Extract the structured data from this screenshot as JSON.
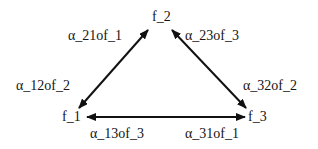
{
  "diagram": {
    "type": "triangle-graph",
    "nodes": [
      {
        "id": "f_2",
        "label": "f_2"
      },
      {
        "id": "f_1",
        "label": "f_1"
      },
      {
        "id": "f_3",
        "label": "f_3"
      }
    ],
    "edges": [
      {
        "from": "f_1",
        "to": "f_2",
        "bidirectional": true,
        "labels": [
          "α_21of_1",
          "α_12of_2"
        ]
      },
      {
        "from": "f_2",
        "to": "f_3",
        "bidirectional": true,
        "labels": [
          "α_23of_3",
          "α_32of_2"
        ]
      },
      {
        "from": "f_1",
        "to": "f_3",
        "bidirectional": true,
        "labels": [
          "α_13of_3",
          "α_31of_1"
        ]
      }
    ],
    "edge_labels": {
      "a21": "α_21of_1",
      "a23": "α_23of_3",
      "a12": "α_12of_2",
      "a32": "α_32of_2",
      "a13": "α_13of_3",
      "a31": "α_31of_1"
    },
    "colors": {
      "line": "#111111",
      "text": "#151515",
      "background": "#ffffff"
    }
  }
}
